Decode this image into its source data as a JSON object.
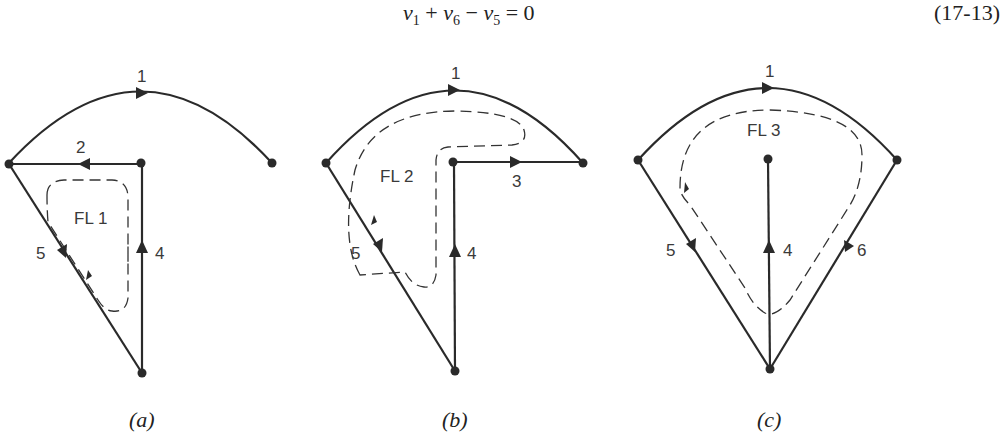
{
  "equation": {
    "terms": [
      {
        "var": "v",
        "sub": "1"
      },
      {
        "op": "+"
      },
      {
        "var": "v",
        "sub": "6"
      },
      {
        "op": "−"
      },
      {
        "var": "v",
        "sub": "5"
      },
      {
        "op": "= 0"
      }
    ],
    "number": "(17-13)"
  },
  "panels": [
    {
      "caption": "(a)",
      "loop_label": "FL 1",
      "edge_labels": {
        "e1": "1",
        "e2": "2",
        "e4": "4",
        "e5": "5"
      },
      "edges": [
        {
          "id": "1",
          "from": "left",
          "to": "right",
          "shape": "arc",
          "direction": "clockwise"
        },
        {
          "id": "2",
          "from": "center",
          "to": "left",
          "shape": "line"
        },
        {
          "id": "4",
          "from": "bottom",
          "to": "center",
          "shape": "line"
        },
        {
          "id": "5",
          "from": "left",
          "to": "bottom",
          "shape": "line"
        }
      ]
    },
    {
      "caption": "(b)",
      "loop_label": "FL 2",
      "edge_labels": {
        "e1": "1",
        "e3": "3",
        "e4": "4",
        "e5": "5"
      },
      "edges": [
        {
          "id": "1",
          "from": "left",
          "to": "right",
          "shape": "arc"
        },
        {
          "id": "3",
          "from": "center",
          "to": "right",
          "shape": "line"
        },
        {
          "id": "4",
          "from": "bottom",
          "to": "center",
          "shape": "line"
        },
        {
          "id": "5",
          "from": "left",
          "to": "bottom",
          "shape": "line"
        }
      ]
    },
    {
      "caption": "(c)",
      "loop_label": "FL 3",
      "edge_labels": {
        "e1": "1",
        "e4": "4",
        "e5": "5",
        "e6": "6"
      },
      "edges": [
        {
          "id": "1",
          "from": "left",
          "to": "right",
          "shape": "arc"
        },
        {
          "id": "4",
          "from": "bottom",
          "to": "center",
          "shape": "line"
        },
        {
          "id": "5",
          "from": "left",
          "to": "bottom",
          "shape": "line"
        },
        {
          "id": "6",
          "from": "right",
          "to": "bottom",
          "shape": "line"
        }
      ]
    }
  ]
}
